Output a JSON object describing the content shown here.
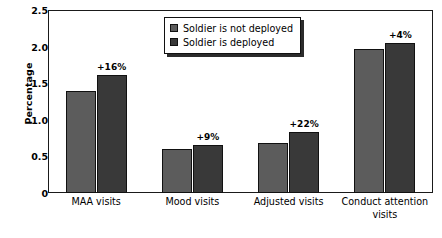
{
  "chart_data": {
    "type": "bar",
    "title": "",
    "xlabel": "",
    "ylabel": "Percentage",
    "ylim": [
      0,
      2.5
    ],
    "yticks": [
      "0",
      "0.5",
      "1.0",
      "1.5",
      "2.0",
      "2.5"
    ],
    "ytick_values": [
      0,
      0.5,
      1.0,
      1.5,
      2.0,
      2.5
    ],
    "grid": false,
    "legend_position": "top-center",
    "categories": [
      "MAA visits",
      "Mood visits",
      "Adjusted visits",
      "Conduct attention visits"
    ],
    "series": [
      {
        "name": "Soldier is not deployed",
        "color": "#5c5c5c",
        "values": [
          1.39,
          0.6,
          0.68,
          1.97
        ]
      },
      {
        "name": "Soldier is deployed",
        "color": "#393939",
        "values": [
          1.61,
          0.65,
          0.83,
          2.05
        ]
      }
    ],
    "annotations": [
      "+16%",
      "+9%",
      "+22%",
      "+4%"
    ]
  },
  "legend": {
    "items": [
      {
        "label": "Soldier is not deployed",
        "swatch": "light"
      },
      {
        "label": "Soldier is deployed",
        "swatch": "dark"
      }
    ]
  },
  "axes": {
    "y_title": "Percentage"
  }
}
